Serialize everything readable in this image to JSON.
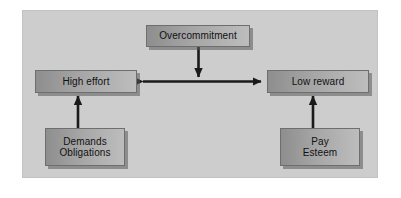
{
  "diagram": {
    "panel": {
      "background_color": "#cdcdcd",
      "border_color": "#c2c2c2"
    },
    "node_style": {
      "gradient_start_color": "#8e8e8e",
      "gradient_end_color": "#bdbdbd",
      "border_color": "#6e6e6e",
      "shadow_color": "#5a5a5a",
      "text_color": "#111111"
    },
    "arrow_color": "#1a1a1a",
    "nodes": [
      {
        "id": "overcommitment",
        "label": "Overcommitment",
        "lines": [
          "Overcommitment"
        ]
      },
      {
        "id": "high-effort",
        "label": "High effort",
        "lines": [
          "High effort"
        ]
      },
      {
        "id": "low-reward",
        "label": "Low reward",
        "lines": [
          "Low reward"
        ]
      },
      {
        "id": "demands-obligations",
        "label": "Demands Obligations",
        "lines": [
          "Demands",
          "Obligations"
        ]
      },
      {
        "id": "pay-esteem",
        "label": "Pay Esteem",
        "lines": [
          "Pay",
          "Esteem"
        ]
      }
    ],
    "connectors": [
      {
        "id": "overcommitment-to-center",
        "from": "overcommitment",
        "to": "effort-reward-link",
        "direction": "down",
        "heads": 1
      },
      {
        "id": "effort-reward-link",
        "from": "high-effort",
        "to": "low-reward",
        "direction": "horizontal",
        "heads": 2
      },
      {
        "id": "demands-to-high-effort",
        "from": "demands-obligations",
        "to": "high-effort",
        "direction": "up",
        "heads": 1
      },
      {
        "id": "pay-to-low-reward",
        "from": "pay-esteem",
        "to": "low-reward",
        "direction": "up",
        "heads": 1
      }
    ]
  }
}
